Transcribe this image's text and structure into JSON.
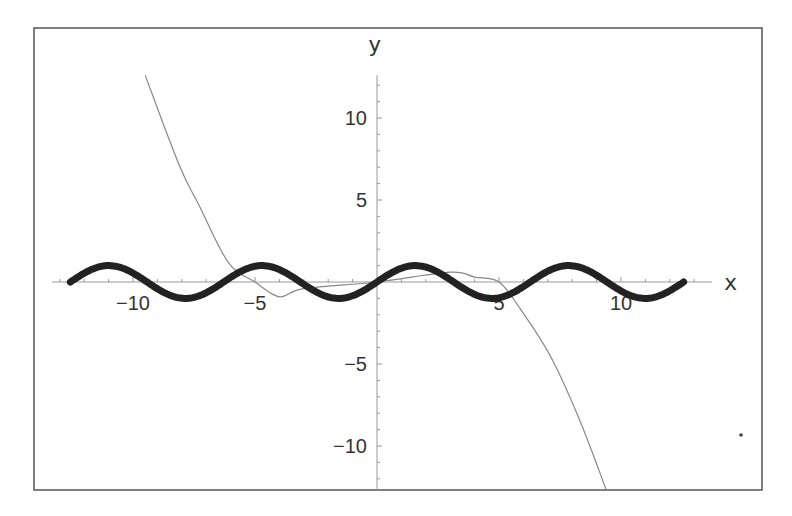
{
  "chart_data": {
    "type": "line",
    "title": "",
    "xlabel": "x",
    "ylabel": "y",
    "xlim": [
      -13.5,
      14.5
    ],
    "ylim": [
      -12.8,
      12.8
    ],
    "grid": false,
    "legend": null,
    "x_ticks": [
      -10,
      -5,
      5,
      10
    ],
    "x_tick_labels": [
      "−10",
      "−5",
      "5",
      "10"
    ],
    "y_ticks": [
      10,
      5,
      -5,
      -10
    ],
    "y_tick_labels": [
      "10",
      "5",
      "−5",
      "−10"
    ],
    "series": [
      {
        "name": "sin(x)",
        "style": "thick",
        "color": "#222222",
        "x_range": [
          -12.57,
          12.57
        ],
        "points": [
          [
            -12.57,
            0
          ],
          [
            -11,
            1.0
          ],
          [
            -9.42,
            1.0
          ],
          [
            -7.85,
            1.0
          ],
          [
            -6.28,
            0
          ],
          [
            -4.71,
            -1
          ],
          [
            -3.14,
            0
          ],
          [
            0,
            0
          ],
          [
            1.57,
            1
          ],
          [
            3.14,
            0
          ],
          [
            4.71,
            -1
          ],
          [
            6.28,
            0
          ],
          [
            7.85,
            1
          ],
          [
            9.42,
            0
          ],
          [
            11,
            -1
          ],
          [
            12.57,
            0
          ]
        ]
      },
      {
        "name": "Taylor polynomial approximation",
        "style": "thin",
        "color": "#888888",
        "points": [
          [
            -9.5,
            12.6
          ],
          [
            -8.1,
            7.1
          ],
          [
            -7.3,
            4.7
          ],
          [
            -6.1,
            1.2
          ],
          [
            -5.0,
            0.0
          ],
          [
            -4.0,
            -0.9
          ],
          [
            -3.0,
            -0.4
          ],
          [
            0,
            0
          ],
          [
            3.0,
            0.6
          ],
          [
            4.0,
            0.3
          ],
          [
            5.0,
            0.0
          ],
          [
            5.9,
            -1.7
          ],
          [
            7.1,
            -4.5
          ],
          [
            8.3,
            -8.4
          ],
          [
            9.4,
            -12.7
          ]
        ]
      }
    ]
  },
  "plot": {
    "frame_color": "#555555",
    "axis_color": "#999999",
    "text_color": "#333333"
  }
}
